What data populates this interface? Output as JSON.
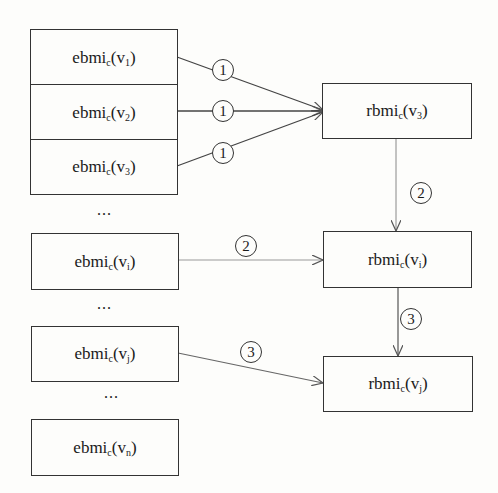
{
  "left_nodes": [
    {
      "base": "ebmi",
      "sub": "c",
      "arg_base": "v",
      "arg_sub": "1"
    },
    {
      "base": "ebmi",
      "sub": "c",
      "arg_base": "v",
      "arg_sub": "2"
    },
    {
      "base": "ebmi",
      "sub": "c",
      "arg_base": "v",
      "arg_sub": "3"
    },
    {
      "base": "ebmi",
      "sub": "c",
      "arg_base": "v",
      "arg_sub": "i"
    },
    {
      "base": "ebmi",
      "sub": "c",
      "arg_base": "v",
      "arg_sub": "j"
    },
    {
      "base": "ebmi",
      "sub": "c",
      "arg_base": "v",
      "arg_sub": "n"
    }
  ],
  "right_nodes": [
    {
      "base": "rbmi",
      "sub": "c",
      "arg_base": "v",
      "arg_sub": "3"
    },
    {
      "base": "rbmi",
      "sub": "c",
      "arg_base": "v",
      "arg_sub": "i"
    },
    {
      "base": "rbmi",
      "sub": "c",
      "arg_base": "v",
      "arg_sub": "j"
    }
  ],
  "ellipsis": [
    "...",
    "...",
    "..."
  ],
  "step_labels": {
    "e1_to_r3": "1",
    "e2_to_r3": "1",
    "e3_to_r3": "1",
    "r3_to_ri": "2",
    "ei_to_ri": "2",
    "ri_to_rj": "3",
    "ej_to_rj": "3"
  },
  "paren_open": "(",
  "paren_close": ")"
}
